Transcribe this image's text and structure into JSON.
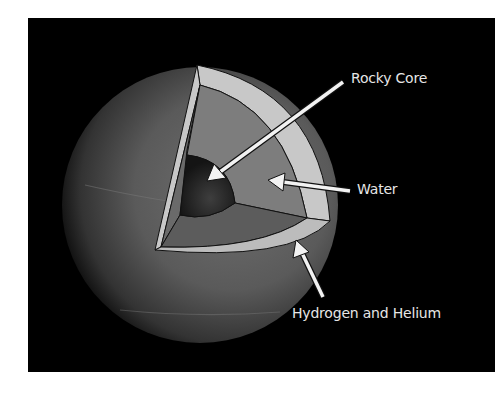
{
  "figure": {
    "background_color": "#000000",
    "page_color": "#ffffff"
  },
  "labels": {
    "rocky_core": "Rocky Core",
    "water": "Water",
    "hydrogen_helium": "Hydrogen and Helium"
  },
  "layers": [
    {
      "name": "Rocky Core",
      "color": "#2a2a2a"
    },
    {
      "name": "Water",
      "color": "#7d7d7d"
    },
    {
      "name": "Hydrogen and Helium",
      "color": "#c8c8c8"
    }
  ],
  "colors": {
    "planet_surface": "#5a5a5a",
    "arrow": "#f2f2f2",
    "label_text": "#e6e6e6",
    "outline": "#111111"
  }
}
